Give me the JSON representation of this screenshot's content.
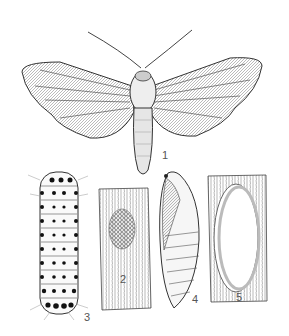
{
  "plate": {
    "subject": "Moth life cycle illustration",
    "background": "#ffffff",
    "ink": "#2a2a2a",
    "figures": [
      {
        "id": "1",
        "label": "1",
        "depicts": "adult moth"
      },
      {
        "id": "2",
        "label": "2",
        "depicts": "egg mass on leaf/bark"
      },
      {
        "id": "3",
        "label": "3",
        "depicts": "larva (caterpillar)"
      },
      {
        "id": "4",
        "label": "4",
        "depicts": "pupa"
      },
      {
        "id": "5",
        "label": "5",
        "depicts": "cocoon on leaf/bark"
      }
    ]
  }
}
